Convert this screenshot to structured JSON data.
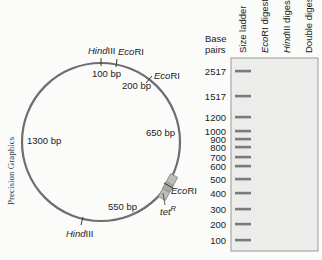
{
  "credit": "Precision Graphics",
  "plasmid": {
    "sites": [
      {
        "name_italic": "Hind",
        "name_rest": "III",
        "label": "HindIII",
        "position": "top"
      },
      {
        "name_italic": "Eco",
        "name_rest": "RI",
        "label": "EcoRI",
        "position": "top-right-1"
      },
      {
        "name_italic": "Eco",
        "name_rest": "RI",
        "label": "EcoRI",
        "position": "top-right-2"
      },
      {
        "name_italic": "Eco",
        "name_rest": "RI",
        "label": "EcoRI",
        "position": "right-lower"
      },
      {
        "name_italic": "Hind",
        "name_rest": "III",
        "label": "HindIII",
        "position": "bottom"
      }
    ],
    "segments": [
      "100 bp",
      "200 bp",
      "650 bp",
      "550 bp",
      "1300 bp"
    ],
    "gene": {
      "name": "tet",
      "superscript": "R"
    }
  },
  "gel": {
    "axis_title_line1": "Base",
    "axis_title_line2": "pairs",
    "lanes": [
      "Size ladder",
      "EcoRI digest",
      "HindIII digest",
      "Double digest"
    ],
    "lane_label_parts": [
      {
        "italic": "",
        "rest": "Size ladder"
      },
      {
        "italic": "Eco",
        "rest": "RI digest"
      },
      {
        "italic": "Hind",
        "rest": "III digest"
      },
      {
        "italic": "",
        "rest": "Double digest"
      }
    ],
    "ladder_bp": [
      "2517",
      "1517",
      "1200",
      "1000",
      "900",
      "800",
      "700",
      "600",
      "500",
      "400",
      "300",
      "200",
      "100"
    ],
    "colors": {
      "band": "#7a7a7a",
      "gel_bg": "#ececea",
      "gel_border": "#9a9a9a"
    }
  }
}
